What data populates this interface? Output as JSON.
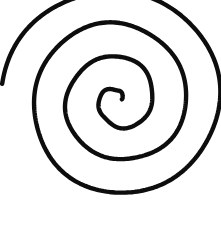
{
  "figure": {
    "kind": "line-drawing",
    "background_color": "#ffffff",
    "stroke_color": "#0d0d0d",
    "stroke_width_px": 4.4,
    "canvas": {
      "width": 221,
      "height": 231
    }
  },
  "chart_data": {
    "type": "line",
    "xlabel": "",
    "ylabel": "",
    "grid": false,
    "legend": null,
    "xlim": [
      0,
      221
    ],
    "ylim": [
      0,
      231
    ],
    "geometry": {
      "curve": "archimedean-spiral",
      "center": {
        "x": 118,
        "y": 100
      },
      "turns": 3.45,
      "direction": "counterclockwise-outward",
      "start_radius_px": 3,
      "end_radius_px": 101,
      "radius_growth_per_turn_px": 33,
      "start_angle_deg": 10,
      "end_point": {
        "x": 218,
        "y": 160
      },
      "horizontal_crossings_at_y100": [
        18,
        50,
        82,
        110,
        126,
        138,
        172,
        205
      ],
      "vertical_crossings_at_x117": [
        14,
        50,
        88,
        108,
        130,
        163,
        213
      ],
      "bounds": {
        "left": 17,
        "top": 12,
        "right": 219,
        "bottom": 217
      }
    },
    "path_d": "M 120.9 98.5 C 123.2 100.4 123.0 104.2 120.3 106.2 C 116.8 108.8 111.6 107.9 108.4 104.4 C 104.4 100.0 105.0 93.3 109.6 89.2 C 115.1 84.3 123.5 85.0 128.8 90.6 C 135.0 97.1 134.2 107.3 127.6 113.6 C 120.0 120.9 108.0 120.0 100.5 112.0 C 92.0 102.9 93.0 88.8 102.2 80.5 C 112.4 71.3 128.3 72.4 137.5 82.9 C 147.5 94.3 146.3 111.6 135.0 121.9 C 122.8 133.0 103.8 131.7 93.0 119.4 C 81.4 106.1 82.8 85.3 96.1 73.5 C 110.3 60.8 132.5 62.3 145.1 76.7 C 158.5 92.0 156.9 115.6 141.7 129.2 C 125.5 143.6 100.2 141.9 86.0 125.5 C 71.0 108.2 72.8 81.4 90.1 66.2 C 108.3 50.2 136.0 52.1 152.0 70.5 C 168.8 89.8 166.8 119.2 147.6 136.2 C 127.4 154.0 96.4 151.9 78.7 131.5 C 60.1 110.1 62.3 77.2 83.8 58.4 C 106.3 38.7 140.7 41.1 160.4 63.9 C 181.0 87.7 178.4 124.1 154.7 144.9 C 130.0 166.6 92.2 163.8 70.7 138.9 C 48.3 113.0 51.2 72.6 77.3 49.6 C 104.5 25.6 145.6 28.6 169.5 56.1 C 194.4 84.7 191.3 129.0 163.0 154.2 C 133.6 180.4 89.0 177.1 63.1 147.2 C 36.3 116.2 39.8 68.9 70.5 41.8 C 102.3 13.7 150.4 17.2 178.2 49.2 C 207.0 82.4 203.3 132.9 169.7 161.2 C 150.0 177.8 126.9 184.2 105.6 181.6",
    "path_d_full": "M 120.9 98.5 C 123.2 100.4 123.0 104.2 120.3 106.2 C 116.8 108.8 111.6 107.9 108.4 104.4 C 104.4 100.0 105.0 93.3 109.6 89.2 C 115.1 84.3 123.5 85.0 128.8 90.6 C 135.0 97.1 134.2 107.3 127.6 113.6 C 120.0 120.9 108.0 120.0 100.5 112.0 C 92.0 102.9 93.0 88.8 102.2 80.5 C 112.4 71.3 128.3 72.4 137.5 82.9 C 147.5 94.3 146.3 111.6 135.0 121.9 C 122.8 133.0 103.8 131.7 93.0 119.4 C 81.4 106.1 82.8 85.3 96.1 73.5 C 110.3 60.8 132.5 62.3 145.1 76.7 C 158.5 92.0 156.9 115.6 141.7 129.2 C 125.5 143.6 100.2 141.9 86.0 125.5 C 71.0 108.2 72.8 81.4 90.1 66.2 C 108.3 50.2 136.0 52.1 152.0 70.5 C 168.8 89.8 166.8 119.2 147.6 136.2 C 127.4 154.0 96.4 151.9 78.7 131.5 C 60.1 110.1 62.3 77.2 83.8 58.4 C 106.3 38.7 140.7 41.1 160.4 63.9 C 181.0 87.7 178.4 124.1 154.7 144.9 C 130.0 166.6 92.2 163.8 70.7 138.9 C 48.3 113.0 51.2 72.6 77.3 49.6 C 104.5 25.6 145.6 28.6 169.5 56.1 C 194.4 84.7 191.3 132.9 169.7 161.2 C 150.0 177.8 126.9 184.2 105.6 181.6 C 81.0 178.6 58.5 163.0 44.0 140.5 C 26.5 113.4 24.0 80.0 38.0 53.0 C 54.0 22.2 88.0 7.5 121.5 13.5 C 158.0 20.0 188.5 50.0 200.5 86.0 C 212.0 120.4 205.0 151.0 186.0 172.0"
  }
}
